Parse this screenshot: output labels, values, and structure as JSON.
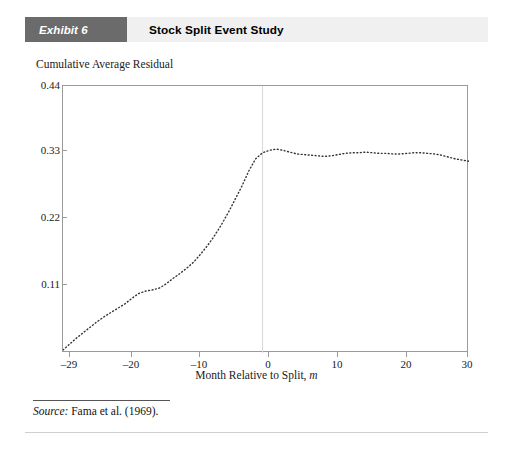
{
  "exhibit": {
    "tag": "Exhibit 6",
    "title": "Stock Split Event Study",
    "tag_bg": "#6b6b6b",
    "band_bg": "#f0f0f0"
  },
  "source": {
    "label": "Source:",
    "text": " Fama et al. (1969)."
  },
  "chart_data": {
    "type": "line",
    "title": "Stock Split Event Study",
    "xlabel": "Month Relative to Split, m",
    "ylabel": "Cumulative Average Residual",
    "xlim": [
      -29,
      30
    ],
    "ylim": [
      0.0,
      0.44
    ],
    "grid": false,
    "legend": null,
    "line_style": "dotted",
    "line_color": "#333333",
    "reference_line": {
      "x": 0,
      "color": "#d8d8d8",
      "label": "split month"
    },
    "xticks": [
      -29,
      -20,
      -10,
      0,
      10,
      20,
      30
    ],
    "xtick_labels": [
      "–29",
      "–20",
      "–10",
      "0",
      "10",
      "20",
      "30"
    ],
    "yticks": [
      0.11,
      0.22,
      0.33,
      0.44
    ],
    "ytick_labels": [
      "0.11",
      "0.22",
      "0.33",
      "0.44"
    ],
    "x": [
      -29,
      -28,
      -27,
      -26,
      -25,
      -24,
      -23,
      -22,
      -21,
      -20,
      -19,
      -18,
      -17,
      -16,
      -15,
      -14,
      -13,
      -12,
      -11,
      -10,
      -9,
      -8,
      -7,
      -6,
      -5,
      -4,
      -3,
      -2,
      -1,
      0,
      1,
      2,
      3,
      4,
      5,
      6,
      7,
      8,
      9,
      10,
      11,
      12,
      13,
      14,
      15,
      16,
      17,
      18,
      19,
      20,
      21,
      22,
      23,
      24,
      25,
      26,
      27,
      28,
      29,
      30
    ],
    "y": [
      0.005,
      0.015,
      0.025,
      0.034,
      0.043,
      0.052,
      0.06,
      0.067,
      0.074,
      0.081,
      0.09,
      0.098,
      0.102,
      0.104,
      0.107,
      0.114,
      0.123,
      0.131,
      0.14,
      0.15,
      0.163,
      0.177,
      0.193,
      0.211,
      0.231,
      0.253,
      0.275,
      0.3,
      0.32,
      0.33,
      0.334,
      0.336,
      0.334,
      0.331,
      0.328,
      0.327,
      0.326,
      0.325,
      0.324,
      0.325,
      0.327,
      0.329,
      0.33,
      0.33,
      0.331,
      0.33,
      0.329,
      0.329,
      0.328,
      0.328,
      0.329,
      0.33,
      0.33,
      0.329,
      0.328,
      0.326,
      0.323,
      0.32,
      0.318,
      0.316
    ]
  }
}
